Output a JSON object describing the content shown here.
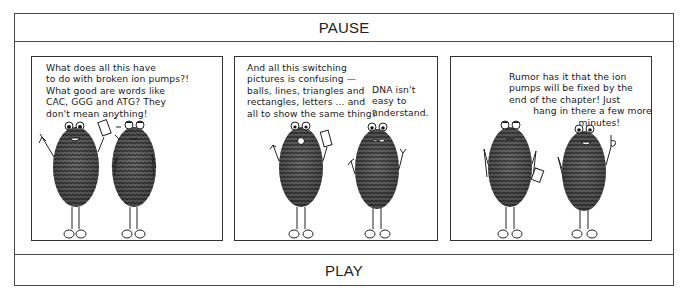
{
  "controls": {
    "pause_label": "PAUSE",
    "play_label": "PLAY"
  },
  "comic": {
    "panels": [
      {
        "speech": [
          {
            "speaker": "left-character",
            "text": "What does all this have\nto do with broken ion pumps?!\nWhat good are words like\nCAC, GGG and ATG? They\ndon't mean anything!"
          }
        ],
        "characters": [
          {
            "role": "left",
            "expression": "speaking-smile",
            "prop": "card-held-up",
            "pose": "arm-raised"
          },
          {
            "role": "right",
            "expression": "neutral",
            "pose": "hands-on-hips"
          }
        ]
      },
      {
        "speech": [
          {
            "speaker": "left-character",
            "text": "And all this switching\npictures is confusing —\nballs, lines, triangles and\nrectangles, letters ... and\nall to show the same thing?"
          },
          {
            "speaker": "right-character",
            "text": "DNA isn't\neasy to\nunderstand."
          }
        ],
        "characters": [
          {
            "role": "left",
            "expression": "surprised",
            "prop": "card"
          },
          {
            "role": "right",
            "expression": "grimace",
            "pose": "hands-up"
          }
        ]
      },
      {
        "speech": [
          {
            "speaker": "right-character",
            "text": "Rumor has it that the ion\npumps will be fixed by the\nend of the chapter! Just\n        hang in there a few more\n                       minutes!"
          }
        ],
        "characters": [
          {
            "role": "left",
            "expression": "neutral",
            "prop": "card-at-side",
            "pose": "hand-on-hip"
          },
          {
            "role": "right",
            "expression": "smile",
            "pose": "finger-pointing-up"
          }
        ]
      }
    ]
  },
  "colors": {
    "ink": "#1a1a1a",
    "border": "#4a4a4a",
    "background": "#ffffff"
  }
}
